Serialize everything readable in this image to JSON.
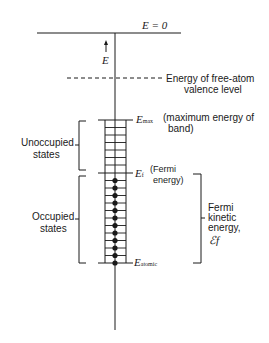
{
  "diagram": {
    "top_label": "E = 0",
    "axis_label": "E",
    "free_atom_label_line1": "Energy of free-atom",
    "free_atom_label_line2": "valence level",
    "emax_symbol": "E",
    "emax_sub": "max",
    "emax_desc_line1": "(maximum energy of",
    "emax_desc_line2": "band)",
    "fermi_symbol": "E",
    "fermi_sub": "f",
    "fermi_desc_line1": "(Fermi",
    "fermi_desc_line2": "energy)",
    "atomic_symbol": "E",
    "atomic_sub": "atomic",
    "unoccupied_line1": "Unoccupied",
    "unoccupied_line2": "states",
    "occupied_line1": "Occupied",
    "occupied_line2": "states",
    "fermi_ke_line1": "Fermi",
    "fermi_ke_line2": "kinetic",
    "fermi_ke_line3": "energy,",
    "fermi_ke_symbol": "ℰf",
    "occupied_dot_count": 12,
    "unoccupied_rung_count": 7
  }
}
